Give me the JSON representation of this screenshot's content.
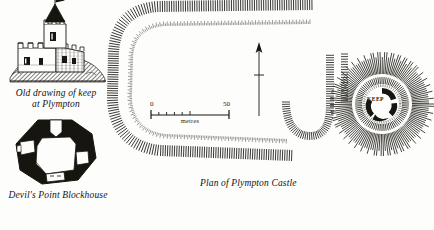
{
  "page": {
    "background_color": "#fdfdfc",
    "ink_color": "#17150f"
  },
  "figures": {
    "keep_drawing": {
      "caption_line1": "Old drawing of keep",
      "caption_line2": "at Plympton",
      "subject": "castle-keep-engraving"
    },
    "blockhouse": {
      "caption": "Devil's Point Blockhouse",
      "subject": "octagonal-blockhouse-plan"
    },
    "castle_plan": {
      "caption": "Plan of Plympton Castle",
      "subject": "earthwork-hachure-plan"
    },
    "motte": {
      "label": "KEEP",
      "subject": "motte-with-shell-keep"
    }
  },
  "scale_bar": {
    "min_label": "0",
    "max_label": "50",
    "unit_label": "metres",
    "minor_ticks": 5,
    "range_metres": 50
  },
  "north_arrow": {
    "name": "north-arrow",
    "direction": "up"
  },
  "chart_data": {
    "type": "diagram",
    "elements": [
      {
        "name": "old-drawing-of-keep",
        "position": "top-left"
      },
      {
        "name": "devils-point-blockhouse",
        "position": "bottom-left"
      },
      {
        "name": "plan-of-plympton-castle",
        "position": "centre"
      },
      {
        "name": "motte-keep-detail",
        "position": "right"
      }
    ],
    "scale": {
      "from": 0,
      "to": 50,
      "unit": "metres"
    }
  }
}
